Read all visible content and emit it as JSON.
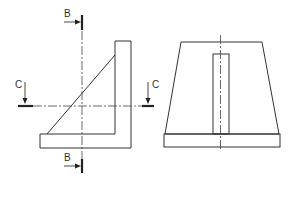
{
  "drawing": {
    "type": "orthographic-technical-drawing",
    "views": [
      {
        "name": "front-view",
        "description": "L-shaped bracket with triangular gusset"
      },
      {
        "name": "side-view",
        "description": "Trapezoidal profile on rectangular base with central rib"
      }
    ],
    "section_markers": {
      "B_top": {
        "label": "B"
      },
      "B_bottom": {
        "label": "B"
      },
      "C_left": {
        "label": "C"
      },
      "C_right": {
        "label": "C"
      }
    },
    "colors": {
      "line": "#333333",
      "background": "#ffffff"
    }
  }
}
